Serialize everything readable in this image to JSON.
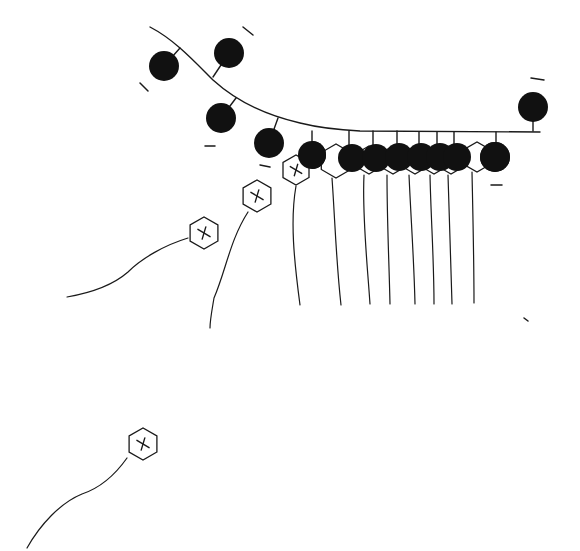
{
  "diagram": {
    "colors": {
      "ink": "#1a1a1a",
      "negative_fill": "#111111",
      "positive_fill": "#ffffff",
      "background": "#ffffff"
    },
    "surface": {
      "path": "M150,27 C175,40 195,62 213,80 C235,100 265,115 300,123 C320,128 340,130 360,131 L540,132"
    },
    "surface_negatives": [
      {
        "cx": 164,
        "cy": 66,
        "r": 15,
        "tx": 180,
        "ty": 48
      },
      {
        "cx": 229,
        "cy": 53,
        "r": 15,
        "tx": 213,
        "ty": 77
      },
      {
        "cx": 221,
        "cy": 118,
        "r": 15,
        "tx": 236,
        "ty": 98
      },
      {
        "cx": 269,
        "cy": 143,
        "r": 15,
        "tx": 278,
        "ty": 118
      },
      {
        "cx": 533,
        "cy": 107,
        "r": 15,
        "tx": 533,
        "ty": 131
      }
    ],
    "minus_marks": [
      {
        "x1": 243,
        "y1": 27,
        "x2": 253,
        "y2": 35
      },
      {
        "x1": 140,
        "y1": 83,
        "x2": 148,
        "y2": 91
      },
      {
        "x1": 205,
        "y1": 146,
        "x2": 215,
        "y2": 146
      },
      {
        "x1": 260,
        "y1": 165,
        "x2": 270,
        "y2": 167
      },
      {
        "x1": 531,
        "y1": 78,
        "x2": 544,
        "y2": 80
      },
      {
        "x1": 491,
        "y1": 185,
        "x2": 502,
        "y2": 185
      },
      {
        "x1": 524,
        "y1": 318,
        "x2": 528,
        "y2": 321
      }
    ],
    "row_negatives": [
      {
        "cx": 312,
        "cy": 155,
        "r": 14
      },
      {
        "cx": 352,
        "cy": 158,
        "r": 14
      },
      {
        "cx": 376,
        "cy": 158,
        "r": 14
      },
      {
        "cx": 399,
        "cy": 157,
        "r": 14
      },
      {
        "cx": 421,
        "cy": 157,
        "r": 14
      },
      {
        "cx": 440,
        "cy": 157,
        "r": 14
      },
      {
        "cx": 457,
        "cy": 157,
        "r": 14
      },
      {
        "cx": 495,
        "cy": 157,
        "r": 15
      }
    ],
    "row_positives": [
      {
        "cx": 336,
        "cy": 161,
        "r": 17
      },
      {
        "cx": 369,
        "cy": 160,
        "r": 14
      },
      {
        "cx": 393,
        "cy": 160,
        "r": 14
      },
      {
        "cx": 415,
        "cy": 160,
        "r": 14
      },
      {
        "cx": 434,
        "cy": 160,
        "r": 14
      },
      {
        "cx": 451,
        "cy": 160,
        "r": 14
      },
      {
        "cx": 477,
        "cy": 157,
        "r": 15
      }
    ],
    "row_tethers": [
      {
        "x": 312,
        "y1": 131,
        "y2": 142
      },
      {
        "x": 349,
        "y1": 131,
        "y2": 145
      },
      {
        "x": 373,
        "y1": 131,
        "y2": 145
      },
      {
        "x": 397,
        "y1": 131,
        "y2": 145
      },
      {
        "x": 419,
        "y1": 132,
        "y2": 145
      },
      {
        "x": 437,
        "y1": 132,
        "y2": 145
      },
      {
        "x": 454,
        "y1": 132,
        "y2": 145
      },
      {
        "x": 496,
        "y1": 132,
        "y2": 143
      }
    ],
    "row_tails": [
      "M332,178 C335,220 336,260 341,305",
      "M364,175 C362,215 367,260 370,304",
      "M387,175 C387,220 389,260 390,304",
      "M409,175 C411,220 414,260 415,304",
      "M430,175 C431,220 434,260 434,304",
      "M448,175 C449,220 451,260 452,304",
      "M472,172 C473,220 474,260 474,303"
    ],
    "free_positives": [
      {
        "cx": 296,
        "cy": 170,
        "r": 15,
        "tail": "M296,186 C290,220 294,260 300,305"
      },
      {
        "cx": 257,
        "cy": 196,
        "r": 16,
        "tail": "M248,212 C230,240 226,270 214,298 C212,310 210,320 210,328"
      },
      {
        "cx": 204,
        "cy": 233,
        "r": 16,
        "tail": "M188,238 C165,245 142,258 128,272 C112,286 90,293 67,297"
      },
      {
        "cx": 143,
        "cy": 444,
        "r": 16,
        "tail": "M127,458 C115,475 100,488 82,494 C60,503 40,525 27,548"
      }
    ]
  }
}
